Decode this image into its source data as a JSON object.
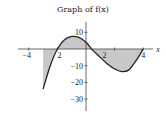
{
  "chart_data": {
    "type": "line",
    "title": "Graph of f(x)",
    "xlabel": "x",
    "ylabel": "",
    "xlim": [
      -4.5,
      4.6
    ],
    "ylim": [
      -35,
      15
    ],
    "x_ticks": [
      -4,
      -2,
      2,
      4
    ],
    "x_tick_labels": [
      "−4",
      "2",
      "2",
      "4"
    ],
    "y_ticks": [
      10,
      -10,
      -20,
      -30
    ],
    "y_tick_labels": [
      "10",
      "−10",
      "−20",
      "−30"
    ],
    "grid": false,
    "legend": null,
    "series": [
      {
        "name": "f(x)",
        "x": [
          -3,
          -2.5,
          -2,
          -1.5,
          -1,
          -0.5,
          0,
          0.5,
          1,
          1.5,
          2,
          2.5,
          3,
          3.5,
          4
        ],
        "values": [
          -24,
          -10,
          0,
          5.5,
          7.5,
          7,
          4,
          -1,
          -5,
          -9,
          -12,
          -13.5,
          -12.5,
          -7,
          0
        ]
      }
    ],
    "shaded_regions": [
      {
        "from": -3,
        "to": -2,
        "between": "curve and x-axis",
        "sign": "negative"
      },
      {
        "from": -2,
        "to": 0.4,
        "between": "curve and x-axis",
        "sign": "positive"
      },
      {
        "from": 0.4,
        "to": 4,
        "between": "curve and x-axis",
        "sign": "negative"
      }
    ],
    "colors": {
      "shade": "#c8c8c8",
      "curve": "#222222",
      "axis": "#444444"
    }
  }
}
